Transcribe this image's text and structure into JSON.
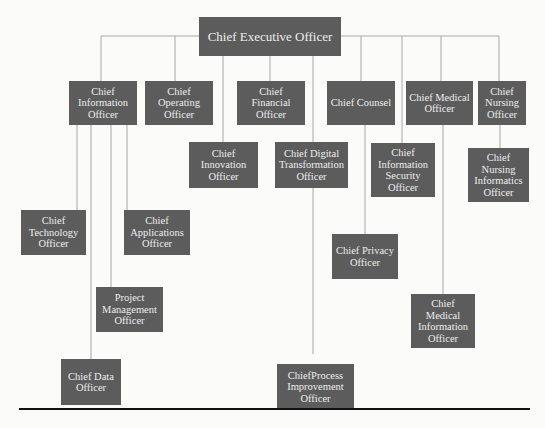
{
  "chart_title": "",
  "colors": {
    "box_fill": "#5c5c5c",
    "box_text": "#ededed",
    "connector": "#a8a8a8",
    "rule": "#111111"
  },
  "nodes": {
    "ceo": {
      "label": "Chief Executive Officer"
    },
    "cio": {
      "label": "Chief Information Officer"
    },
    "coo": {
      "label": "Chief Operating Officer"
    },
    "cfo": {
      "label": "Chief Financial Officer"
    },
    "counsel": {
      "label": "Chief Counsel"
    },
    "cmo": {
      "label": "Chief Medical Officer"
    },
    "cno": {
      "label": "Chief Nursing Officer"
    },
    "innovation": {
      "label": "Chief Innovation Officer"
    },
    "cdto": {
      "label": "Chief Digital Transformation Officer"
    },
    "ciso": {
      "label": "Chief Information Security Officer"
    },
    "cnio": {
      "label": "Chief Nursing Informatics Officer"
    },
    "cto": {
      "label": "Chief Technology Officer"
    },
    "cao": {
      "label": "Chief Applications Officer"
    },
    "pmo": {
      "label": "Project Management Officer"
    },
    "cdo": {
      "label": "Chief Data Officer"
    },
    "privacy": {
      "label": "Chief Privacy Officer"
    },
    "cmio": {
      "label": "Chief Medical Information Officer"
    },
    "cpio": {
      "label": "ChiefProcess Improvement Officer"
    }
  },
  "hierarchy": {
    "ceo": [
      "cio",
      "coo",
      "cfo",
      "counsel",
      "cmo",
      "cno",
      "innovation",
      "cdto",
      "ciso"
    ],
    "cio": [
      "cto",
      "cdo",
      "pmo",
      "cao"
    ],
    "cdto": [
      "cpio"
    ],
    "counsel": [
      "privacy"
    ],
    "cmo": [
      "cmio"
    ],
    "cno": [
      "cnio"
    ]
  }
}
